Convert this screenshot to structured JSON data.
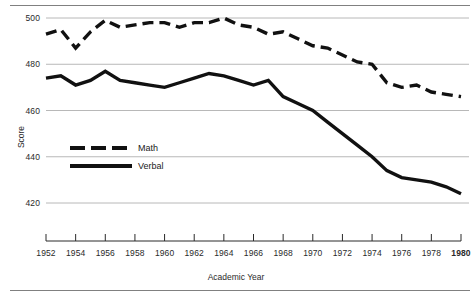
{
  "chart_data": {
    "type": "line",
    "title": "",
    "xlabel": "Academic Year",
    "ylabel": "Score",
    "x": [
      1952,
      1953,
      1954,
      1955,
      1956,
      1957,
      1958,
      1959,
      1960,
      1961,
      1962,
      1963,
      1964,
      1965,
      1966,
      1967,
      1968,
      1969,
      1970,
      1971,
      1972,
      1973,
      1974,
      1975,
      1976,
      1977,
      1978,
      1979,
      1980
    ],
    "xticks": [
      "1952",
      "1954",
      "1956",
      "1958",
      "1960",
      "1962",
      "1964",
      "1966",
      "1968",
      "1970",
      "1972",
      "1974",
      "1976",
      "1978",
      "1980"
    ],
    "yticks": [
      "420",
      "440",
      "460",
      "480",
      "500"
    ],
    "xlim": [
      1952,
      1980
    ],
    "ylim": [
      416,
      503
    ],
    "grid": "horizontal",
    "legend_position": "inside-lower-left",
    "series": [
      {
        "name": "Math",
        "style": "dashed",
        "color": "#111111",
        "values": [
          493,
          495,
          487,
          494,
          499,
          496,
          497,
          498,
          498,
          496,
          498,
          498,
          500,
          497,
          496,
          493,
          494,
          491,
          488,
          487,
          484,
          481,
          480,
          472,
          470,
          471,
          468,
          467,
          466
        ]
      },
      {
        "name": "Verbal",
        "style": "solid",
        "color": "#111111",
        "values": [
          474,
          475,
          471,
          473,
          477,
          473,
          472,
          471,
          470,
          472,
          474,
          476,
          475,
          473,
          471,
          473,
          466,
          463,
          460,
          455,
          450,
          445,
          440,
          434,
          431,
          430,
          429,
          427,
          424
        ]
      }
    ]
  },
  "legend": {
    "math_label": "Math",
    "verbal_label": "Verbal"
  },
  "axis": {
    "y_title": "Score",
    "x_title": "Academic Year"
  }
}
